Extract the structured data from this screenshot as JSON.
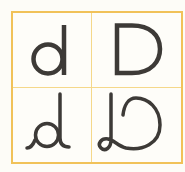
{
  "figure": {
    "grid_color": "#f1c259",
    "divider_color": "#f5d88a",
    "stroke_color": "#3d3a37",
    "cells": [
      {
        "position": "top-left",
        "glyph": "d",
        "style": "print lowercase"
      },
      {
        "position": "top-right",
        "glyph": "D",
        "style": "print uppercase"
      },
      {
        "position": "bottom-left",
        "glyph": "d",
        "style": "cursive lowercase"
      },
      {
        "position": "bottom-right",
        "glyph": "D",
        "style": "cursive uppercase"
      }
    ]
  }
}
